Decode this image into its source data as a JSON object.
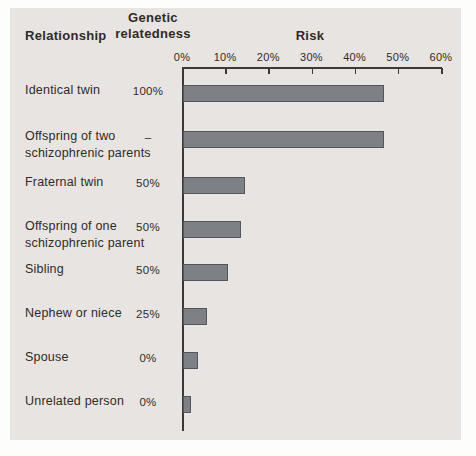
{
  "figure": {
    "headers": {
      "relationship": "Relationship",
      "relatedness_line1": "Genetic",
      "relatedness_line2": "relatedness",
      "risk": "Risk"
    }
  },
  "chart_data": {
    "type": "bar",
    "orientation": "horizontal",
    "title": "Risk",
    "xlabel": "Risk",
    "ylabel": "Relationship",
    "xlim": [
      0,
      60
    ],
    "x_ticks": [
      "0%",
      "10%",
      "20%",
      "30%",
      "40%",
      "50%",
      "60%"
    ],
    "grid": false,
    "legend": "none",
    "columns": [
      "Relationship",
      "Genetic relatedness",
      "Risk"
    ],
    "rows": [
      {
        "relationship_lines": [
          "Identical twin"
        ],
        "genetic_relatedness": "100%",
        "risk_percent": 46
      },
      {
        "relationship_lines": [
          "Offspring of two",
          "schizophrenic parents"
        ],
        "genetic_relatedness": "–",
        "risk_percent": 46
      },
      {
        "relationship_lines": [
          "Fraternal twin"
        ],
        "genetic_relatedness": "50%",
        "risk_percent": 14
      },
      {
        "relationship_lines": [
          "Offspring of one",
          "schizophrenic parent"
        ],
        "genetic_relatedness": "50%",
        "risk_percent": 13
      },
      {
        "relationship_lines": [
          "Sibling"
        ],
        "genetic_relatedness": "50%",
        "risk_percent": 10
      },
      {
        "relationship_lines": [
          "Nephew or niece"
        ],
        "genetic_relatedness": "25%",
        "risk_percent": 5
      },
      {
        "relationship_lines": [
          "Spouse"
        ],
        "genetic_relatedness": "0%",
        "risk_percent": 3
      },
      {
        "relationship_lines": [
          "Unrelated person"
        ],
        "genetic_relatedness": "0%",
        "risk_percent": 1.5
      }
    ],
    "colors": {
      "page_background": "#fdfdfc",
      "panel_background": "#e8e4e1",
      "bar_fill": "#7d8185",
      "bar_border": "#53565a",
      "axis": "#3b3835",
      "text": "#2f2b28"
    }
  }
}
